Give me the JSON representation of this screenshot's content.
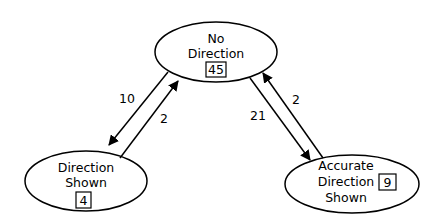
{
  "diagram": {
    "type": "state-transition",
    "nodes": [
      {
        "id": "no-direction",
        "lines": [
          "No",
          "Direction"
        ],
        "count": "45"
      },
      {
        "id": "direction-shown",
        "lines": [
          "Direction",
          "Shown"
        ],
        "count": "4"
      },
      {
        "id": "accurate-direction-shown",
        "lines": [
          "Accurate",
          "Direction",
          "Shown"
        ],
        "count": "9"
      }
    ],
    "edges": [
      {
        "from": "no-direction",
        "to": "direction-shown",
        "label": "10"
      },
      {
        "from": "direction-shown",
        "to": "no-direction",
        "label": "2"
      },
      {
        "from": "no-direction",
        "to": "accurate-direction-shown",
        "label": "21"
      },
      {
        "from": "accurate-direction-shown",
        "to": "no-direction",
        "label": "2"
      }
    ]
  }
}
